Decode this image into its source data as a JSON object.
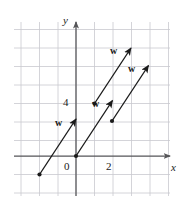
{
  "figure": {
    "kind": "vector-diagram",
    "background": "#ffffff",
    "grid_color": "#c9c9cf",
    "axis_color": "#555558",
    "ink_color": "#1a1a1a"
  },
  "axes": {
    "x_label": "x",
    "y_label": "y",
    "x_tick_labels": [
      {
        "text": "0",
        "value": 0
      },
      {
        "text": "2",
        "value": 2
      }
    ],
    "y_tick_labels": [
      {
        "text": "4",
        "value": 4
      }
    ],
    "origin_px": {
      "x": 76,
      "y": 156
    },
    "unit_px": 18.5,
    "x_range_px": {
      "start": 14,
      "end": 170
    },
    "y_range_px": {
      "start": 22,
      "end": 196
    },
    "x_arrow": true,
    "y_arrow": true
  },
  "grid": {
    "vertical_px": [
      21,
      39.5,
      58,
      76,
      94.5,
      113,
      131.5,
      150,
      168.5
    ],
    "horizontal_px": [
      29.5,
      48,
      66.5,
      85,
      103.5,
      122,
      140.5,
      156,
      174.5,
      193
    ]
  },
  "vectors": [
    {
      "label": "w",
      "tail": {
        "x": 1.0,
        "y": -1.0
      },
      "head": {
        "x": 2.0,
        "y": 1.0
      },
      "tail_px": {
        "x": 39.5,
        "y": 174.5
      },
      "head_px": {
        "x": 76.0,
        "y": 119.0
      },
      "label_px": {
        "x": 55,
        "y": 118
      },
      "dot_at_tail": true
    },
    {
      "label": "w",
      "tail": {
        "x": 0.0,
        "y": 0.0
      },
      "head": {
        "x": 1.0,
        "y": 2.0
      },
      "tail_px": {
        "x": 76.0,
        "y": 156.0
      },
      "head_px": {
        "x": 112.5,
        "y": 100.5
      },
      "label_px": {
        "x": 92,
        "y": 99
      },
      "dot_at_tail": true
    },
    {
      "label": "w",
      "tail": {
        "x": 1.0,
        "y": 2.85
      },
      "head": {
        "x": 2.0,
        "y": 4.85
      },
      "tail_px": {
        "x": 94.5,
        "y": 103.5
      },
      "head_px": {
        "x": 131.0,
        "y": 48.0
      },
      "label_px": {
        "x": 110,
        "y": 46
      },
      "dot_at_tail": true
    },
    {
      "label": "w",
      "tail": {
        "x": 1.95,
        "y": 1.9
      },
      "head": {
        "x": 2.95,
        "y": 3.9
      },
      "tail_px": {
        "x": 112.0,
        "y": 121.0
      },
      "head_px": {
        "x": 148.5,
        "y": 65.5
      },
      "label_px": {
        "x": 128,
        "y": 64
      },
      "dot_at_tail": true
    }
  ],
  "label_positions": {
    "y_axis_name_px": {
      "x": 63,
      "y": 15
    },
    "x_axis_name_px": {
      "x": 171,
      "y": 162
    },
    "zero_px": {
      "x": 64,
      "y": 161
    },
    "two_px": {
      "x": 106,
      "y": 161
    },
    "four_px": {
      "x": 63,
      "y": 97
    }
  }
}
